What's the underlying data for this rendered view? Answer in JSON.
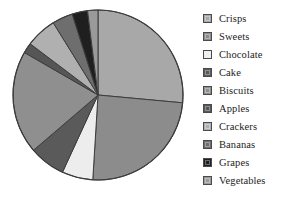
{
  "chart_data": {
    "type": "pie",
    "title": "",
    "subtitle": "",
    "xlabel": "",
    "ylabel": "",
    "grid": false,
    "legend_position": "right",
    "start_angle_deg": 0,
    "direction": "clockwise",
    "center": {
      "x": 98,
      "y": 95
    },
    "radius": 85,
    "categories": [
      "Crisps",
      "Sweets",
      "Chocolate",
      "Cake",
      "Biscuits",
      "Apples",
      "Crackers",
      "Bananas",
      "Grapes",
      "Vegetables"
    ],
    "values": [
      27,
      25,
      6,
      7,
      20,
      2,
      6,
      4,
      3,
      2
    ],
    "slices": [
      {
        "label": "Crisps",
        "value": 27,
        "color": "#a8a8a8",
        "start_deg": 0,
        "end_deg": 97.2
      },
      {
        "label": "Sweets",
        "value": 25,
        "color": "#8c8c8c",
        "start_deg": 97.2,
        "end_deg": 187.2
      },
      {
        "label": "Chocolate",
        "value": 6,
        "color": "#ededed",
        "start_deg": 187.2,
        "end_deg": 208.8
      },
      {
        "label": "Cake",
        "value": 7,
        "color": "#5a5a5a",
        "start_deg": 208.8,
        "end_deg": 234.0
      },
      {
        "label": "Biscuits",
        "value": 20,
        "color": "#8f8f8f",
        "start_deg": 234.0,
        "end_deg": 306.0
      },
      {
        "label": "Apples",
        "value": 2,
        "color": "#565656",
        "start_deg": 306.0,
        "end_deg": 313.2
      },
      {
        "label": "Crackers",
        "value": 6,
        "color": "#b0b0b0",
        "start_deg": 313.2,
        "end_deg": 334.8
      },
      {
        "label": "Bananas",
        "value": 4,
        "color": "#6e6e6e",
        "start_deg": 334.8,
        "end_deg": 349.2
      },
      {
        "label": "Grapes",
        "value": 3,
        "color": "#1f1f1f",
        "start_deg": 349.2,
        "end_deg": 360.0
      },
      {
        "label": "Vegetables",
        "value": 2,
        "color": "#9a9a9a",
        "start_deg": 349.2,
        "end_deg": 360.0
      }
    ],
    "outline_color": "#3d3d3d",
    "background_color": "#ffffff"
  },
  "legend": {
    "items": [
      {
        "label": "Crisps",
        "color": "#a8a8a8"
      },
      {
        "label": "Sweets",
        "color": "#8c8c8c"
      },
      {
        "label": "Chocolate",
        "color": "#ededed"
      },
      {
        "label": "Cake",
        "color": "#5a5a5a"
      },
      {
        "label": "Biscuits",
        "color": "#8f8f8f"
      },
      {
        "label": "Apples",
        "color": "#565656"
      },
      {
        "label": "Crackers",
        "color": "#b0b0b0"
      },
      {
        "label": "Bananas",
        "color": "#6e6e6e"
      },
      {
        "label": "Grapes",
        "color": "#1f1f1f"
      },
      {
        "label": "Vegetables",
        "color": "#9a9a9a"
      }
    ]
  }
}
